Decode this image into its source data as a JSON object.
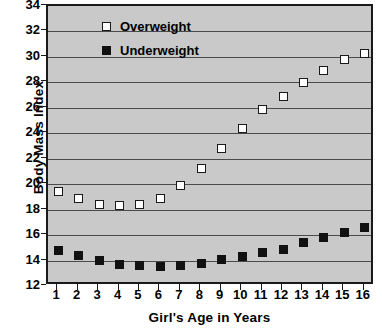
{
  "chart_data": {
    "type": "scatter",
    "title": "",
    "xlabel": "Girl's Age in Years",
    "ylabel": "Body Mass Index",
    "x": [
      1,
      2,
      3,
      4,
      5,
      6,
      7,
      8,
      9,
      10,
      11,
      12,
      13,
      14,
      15,
      16
    ],
    "xtick_labels": [
      "1",
      "2",
      "3",
      "4",
      "5",
      "6",
      "7",
      "8",
      "9",
      "10",
      "11",
      "12",
      "13",
      "14",
      "15",
      "16"
    ],
    "ytick_labels": [
      "12",
      "14",
      "16",
      "18",
      "20",
      "22",
      "24",
      "26",
      "28",
      "30",
      "32",
      "34"
    ],
    "yticks": [
      12,
      14,
      16,
      18,
      20,
      22,
      24,
      26,
      28,
      30,
      32,
      34
    ],
    "xlim": [
      0.5,
      16.5
    ],
    "ylim": [
      12,
      34
    ],
    "grid": "horizontal",
    "legend_position": "top-left",
    "plot_background": "#c9c9c9",
    "series": [
      {
        "name": "Overweight",
        "marker": "open-square",
        "color": "#ffffff",
        "edge_color": "#1a1a1a",
        "values": [
          19.4,
          18.9,
          18.4,
          18.3,
          18.4,
          18.9,
          19.9,
          21.2,
          22.8,
          24.4,
          25.9,
          26.9,
          28.0,
          28.9,
          29.8,
          30.3
        ]
      },
      {
        "name": "Underweight",
        "marker": "filled-square",
        "color": "#111111",
        "edge_color": "#111111",
        "values": [
          14.8,
          14.4,
          14.0,
          13.7,
          13.6,
          13.5,
          13.6,
          13.8,
          14.1,
          14.3,
          14.6,
          14.9,
          15.4,
          15.8,
          16.2,
          16.6
        ]
      }
    ]
  },
  "legend": {
    "items": [
      {
        "label": "Overweight",
        "marker": "open-square"
      },
      {
        "label": "Underweight",
        "marker": "filled-square"
      }
    ]
  }
}
